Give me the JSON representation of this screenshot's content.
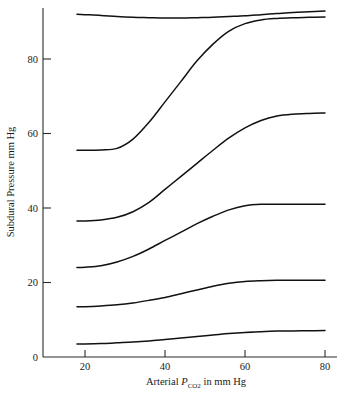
{
  "figure": {
    "background_color": "#ffffff",
    "line_color": "#111111",
    "axis_color": "#2b2b2b"
  },
  "axes": {
    "y_title": "Subdural Pressure mm Hg",
    "x_title_prefix": "Arterial ",
    "x_title_symbol": "P",
    "x_title_subscript": "CO",
    "x_title_subscript2": "2",
    "x_title_suffix": " in mm Hg",
    "y_ticks": [
      "0",
      "20",
      "40",
      "60",
      "80"
    ],
    "x_ticks": [
      "20",
      "40",
      "60",
      "80"
    ]
  },
  "chart_data": {
    "type": "line",
    "title": "",
    "xlabel": "Arterial PCO2 in mm Hg",
    "ylabel": "Subdural Pressure mm Hg",
    "xlim": [
      18,
      80
    ],
    "ylim": [
      0,
      95
    ],
    "grid": false,
    "legend": "none",
    "x": [
      18,
      20,
      24,
      28,
      32,
      36,
      40,
      44,
      48,
      52,
      56,
      60,
      64,
      68,
      72,
      76,
      80
    ],
    "series": [
      {
        "name": "curve-1",
        "values": [
          92.0,
          91.9,
          91.7,
          91.4,
          91.2,
          91.1,
          91.0,
          91.0,
          91.1,
          91.2,
          91.4,
          91.6,
          91.9,
          92.2,
          92.5,
          92.7,
          92.9
        ]
      },
      {
        "name": "curve-2",
        "values": [
          55.5,
          55.5,
          55.6,
          56.0,
          58.5,
          63.0,
          68.5,
          74.0,
          79.5,
          84.0,
          87.5,
          89.5,
          90.5,
          90.9,
          91.1,
          91.2,
          91.3
        ]
      },
      {
        "name": "curve-3",
        "values": [
          36.5,
          36.5,
          36.8,
          37.5,
          39.0,
          41.5,
          45.0,
          48.5,
          52.0,
          55.5,
          58.8,
          61.5,
          63.5,
          64.7,
          65.2,
          65.4,
          65.5
        ]
      },
      {
        "name": "curve-4",
        "values": [
          24.0,
          24.1,
          24.5,
          25.5,
          27.0,
          29.0,
          31.3,
          33.5,
          35.8,
          37.8,
          39.5,
          40.6,
          41.0,
          41.0,
          41.0,
          41.0,
          41.0
        ]
      },
      {
        "name": "curve-5",
        "values": [
          13.5,
          13.5,
          13.7,
          14.0,
          14.5,
          15.2,
          16.0,
          17.0,
          18.0,
          19.0,
          19.8,
          20.3,
          20.5,
          20.6,
          20.6,
          20.6,
          20.6
        ]
      },
      {
        "name": "curve-6",
        "values": [
          3.5,
          3.5,
          3.6,
          3.8,
          4.0,
          4.3,
          4.7,
          5.1,
          5.5,
          5.9,
          6.3,
          6.6,
          6.8,
          6.95,
          7.0,
          7.05,
          7.1
        ]
      }
    ]
  }
}
